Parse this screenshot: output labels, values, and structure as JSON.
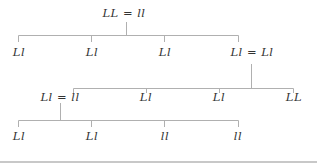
{
  "diagram": {
    "type": "tree",
    "line_color": "#b0b0b0",
    "text_color": "#333333",
    "root": {
      "label": "LL = ll",
      "children": [
        {
          "label": "Ll"
        },
        {
          "label": "Ll"
        },
        {
          "label": "Ll"
        },
        {
          "label": "Ll = Ll",
          "children": [
            {
              "label": "Ll = ll",
              "children": [
                {
                  "label": "Ll"
                },
                {
                  "label": "Ll"
                },
                {
                  "label": "ll"
                },
                {
                  "label": "ll"
                }
              ]
            },
            {
              "label": "Ll"
            },
            {
              "label": "Ll"
            },
            {
              "label": "LL"
            }
          ]
        }
      ]
    },
    "levels": {
      "l0": [
        "LL = ll"
      ],
      "l1": [
        "Ll",
        "Ll",
        "Ll",
        "Ll = Ll"
      ],
      "l2": [
        "Ll = ll",
        "Ll",
        "Ll",
        "LL"
      ],
      "l3": [
        "Ll",
        "Ll",
        "ll",
        "ll"
      ]
    }
  }
}
